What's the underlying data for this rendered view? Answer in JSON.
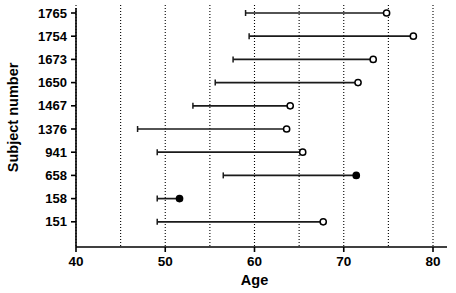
{
  "chart_data": {
    "type": "line",
    "title": "",
    "xlabel": "Age",
    "ylabel": "Subject number",
    "xlim": [
      40,
      80
    ],
    "xticks": [
      40,
      50,
      60,
      70,
      80
    ],
    "xtick_labels": [
      "40",
      "50",
      "60",
      "70",
      "80"
    ],
    "gridlines_x": [
      40,
      45,
      50,
      55,
      60,
      65,
      70,
      75,
      80
    ],
    "grid": true,
    "grid_style": "dotted-vertical",
    "legend": "none",
    "categories": [
      "1765",
      "1754",
      "1673",
      "1650",
      "1467",
      "1376",
      "941",
      "658",
      "158",
      "151"
    ],
    "series": [
      {
        "name": "Age range per subject",
        "points": [
          {
            "subject": "1765",
            "start": 59.0,
            "end": 74.8,
            "marker": "open-circle"
          },
          {
            "subject": "1754",
            "start": 59.4,
            "end": 77.8,
            "marker": "open-circle"
          },
          {
            "subject": "1673",
            "start": 57.6,
            "end": 73.3,
            "marker": "open-circle"
          },
          {
            "subject": "1650",
            "start": 55.6,
            "end": 71.6,
            "marker": "open-circle"
          },
          {
            "subject": "1467",
            "start": 53.1,
            "end": 64.0,
            "marker": "open-circle"
          },
          {
            "subject": "1376",
            "start": 46.9,
            "end": 63.6,
            "marker": "open-circle"
          },
          {
            "subject": "941",
            "start": 49.1,
            "end": 65.4,
            "marker": "open-circle"
          },
          {
            "subject": "658",
            "start": 56.5,
            "end": 71.4,
            "marker": "filled-circle"
          },
          {
            "subject": "158",
            "start": 49.1,
            "end": 51.6,
            "marker": "filled-circle"
          },
          {
            "subject": "151",
            "start": 49.1,
            "end": 67.7,
            "marker": "open-circle"
          }
        ]
      }
    ],
    "colors": {
      "line": "#1a1a1a",
      "axis": "#000000",
      "grid": "#000000",
      "marker_open_fill": "#ffffff",
      "marker_filled_fill": "#000000",
      "background": "#ffffff"
    }
  },
  "axes": {
    "y_title": "Subject number",
    "x_title": "Age",
    "y_tick_labels": [
      "1765",
      "1754",
      "1673",
      "1650",
      "1467",
      "1376",
      "941",
      "658",
      "158",
      "151"
    ],
    "x_tick_labels": [
      "40",
      "50",
      "60",
      "70",
      "80"
    ]
  }
}
